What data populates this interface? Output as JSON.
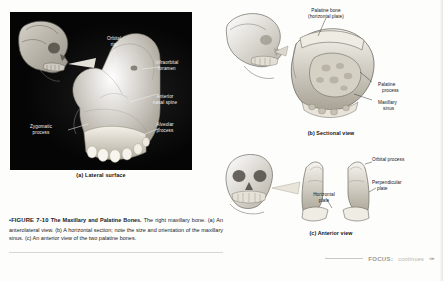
{
  "figure": {
    "number": "•FIGURE 7-10",
    "title": "The Maxillary and Palatine Bones.",
    "body": " The right maxillary bone. (a) An anterolateral view. (b) A horizontal section; note the size and orientation of the maxillary sinus. (c) An anterior view of the two palatine bones."
  },
  "panel_a": {
    "caption": "(a) Lateral surface",
    "labels": [
      {
        "id": "orbital-rim",
        "text": "Orbital\nrim"
      },
      {
        "id": "infraorbital-foramen",
        "text": "Infraorbital\nforamen"
      },
      {
        "id": "anterior-nasal-spine",
        "text": "Anterior\nnasal spine"
      },
      {
        "id": "zygomatic-process",
        "text": "Zygomatic\nprocess"
      },
      {
        "id": "alveolar-process",
        "text": "Alveolar\nprocess"
      }
    ]
  },
  "panel_b": {
    "caption": "(b) Sectional view",
    "labels": [
      {
        "id": "palatine-bone",
        "line1": "Palatine bone",
        "line2": "(horizontal plate)"
      },
      {
        "id": "palatine-process",
        "line1": "Palatine",
        "line2": "process"
      },
      {
        "id": "maxillary-sinus",
        "line1": "Maxillary",
        "line2": "sinus"
      }
    ]
  },
  "panel_c": {
    "caption": "(c) Anterior view",
    "labels": [
      {
        "id": "orbital-process",
        "line1": "Orbital process",
        "line2": ""
      },
      {
        "id": "perpendicular-plate",
        "line1": "Perpendicular",
        "line2": "plate"
      },
      {
        "id": "horizontal-plate",
        "line1": "Horizontal",
        "line2": "plate"
      }
    ]
  },
  "footer": {
    "label": "FOCUS:",
    "continues": "continues",
    "arrow": "➠"
  },
  "colors": {
    "plate_background": "#050505",
    "bone": "#cfc9bd",
    "label_light": "#f2f0ec",
    "label_dark": "#141414",
    "footer_grey": "#9a9894"
  }
}
